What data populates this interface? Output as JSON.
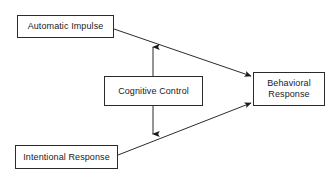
{
  "diagram": {
    "background_color": "#ffffff",
    "line_color": "#2b2b2b",
    "text_color": "#1a1a1a",
    "nodes": [
      {
        "id": "automatic_impulse",
        "label": "Automatic Impulse"
      },
      {
        "id": "intentional_response",
        "label": "Intentional Response"
      },
      {
        "id": "cognitive_control",
        "label": "Cognitive Control"
      },
      {
        "id": "behavioral_response",
        "label": "Behavioral\nResponse"
      }
    ],
    "edges": [
      {
        "id": "automatic_to_behavioral",
        "from": "automatic_impulse",
        "to": "behavioral_response",
        "arrowheads": "end"
      },
      {
        "id": "intentional_to_behavioral",
        "from": "intentional_response",
        "to": "behavioral_response",
        "arrowheads": "end"
      },
      {
        "id": "cognitive_control_vertical",
        "from": "cognitive_control",
        "to": "cognitive_control",
        "arrowheads": "both"
      }
    ]
  }
}
